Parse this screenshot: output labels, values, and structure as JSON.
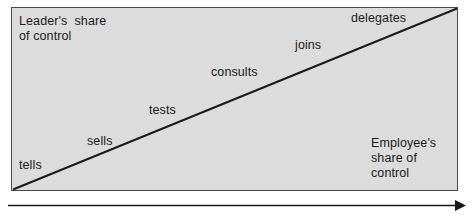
{
  "diagram": {
    "type": "leadership-continuum",
    "axis_labels": {
      "leader": "Leader's  share\nof control",
      "employee": "Employee's\nshare of\ncontrol"
    },
    "continuum_steps": [
      {
        "label": "tells"
      },
      {
        "label": "sells"
      },
      {
        "label": "tests"
      },
      {
        "label": "consults"
      },
      {
        "label": "joins"
      },
      {
        "label": "delegates"
      }
    ],
    "bottom_axis": {
      "direction": "left-to-right",
      "arrowhead": "right"
    },
    "colors": {
      "box_fill": "#dcdcdc",
      "box_border": "#4a4a4a",
      "line": "#1a1a1a",
      "text": "#1a1a1a",
      "page_background": "#ffffff"
    }
  }
}
